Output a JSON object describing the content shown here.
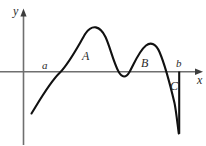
{
  "figure": {
    "axes": {
      "y_label": "y",
      "x_label": "x",
      "x_axis_name": "horizontal-axis",
      "y_axis_name": "vertical-axis",
      "axis_color": "#6f6f6f"
    },
    "points": [
      {
        "id": "a",
        "label": "a",
        "role": "left-root"
      },
      {
        "id": "b",
        "label": "b",
        "role": "right-endpoint"
      }
    ],
    "regions": [
      {
        "id": "A",
        "label": "A",
        "position": "above-axis-first-hump"
      },
      {
        "id": "B",
        "label": "B",
        "position": "above-axis-second-hump"
      },
      {
        "id": "C",
        "label": "C",
        "position": "below-axis-right"
      }
    ],
    "curve": {
      "name": "function-curve",
      "color": "#111111",
      "stroke_width": 2.1,
      "path": "M 31.5 113.5 C 41 98 50 82 60 72.5 C 70 62 78 46 85.5 33.5 C 92 24 100 25.5 105.5 37 C 110 46.5 113 61 118.5 71.5 C 122 78 126 78 129.5 72 C 134 64 139 51 146 45.5 C 151 41.5 156 44 159.5 52 C 164 62.5 170 84 174.5 103 C 176 110 177.5 124 178.8 133.5"
    },
    "vertical_line": {
      "name": "right-boundary-line",
      "color": "#111111",
      "x": 179.2,
      "y_top": 71.5,
      "y_bottom": 133.8
    },
    "background_color": "#ffffff"
  }
}
